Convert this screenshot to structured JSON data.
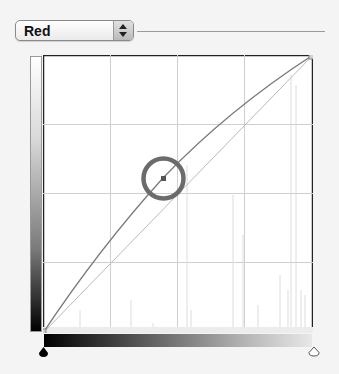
{
  "channel_selector": {
    "selected": "Red",
    "icon": "up-down-stepper-icon"
  },
  "curves_graph": {
    "grid_divisions": 4,
    "input_range": [
      0,
      255
    ],
    "output_range": [
      0,
      255
    ],
    "curve_color": "#7a7a7a",
    "baseline_color": "#b9b9b9",
    "highlight_circle_color": "#6b6b6b",
    "control_points": [
      {
        "input": 0,
        "output": 0
      },
      {
        "input": 114,
        "output": 142
      },
      {
        "input": 255,
        "output": 255
      }
    ]
  },
  "sliders": {
    "black_point_icon": "black-triangle-icon",
    "white_point_icon": "white-triangle-icon"
  }
}
